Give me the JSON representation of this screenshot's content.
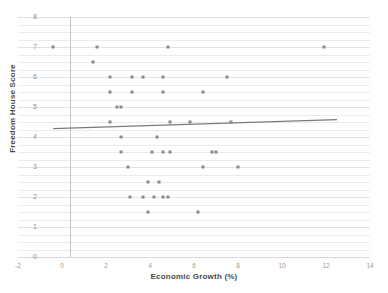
{
  "chart_data": {
    "type": "scatter",
    "title": "",
    "xlabel": "Economic Growth (%)",
    "ylabel": "Freedom House Score",
    "xlim": [
      -2,
      14
    ],
    "ylim": [
      0,
      8
    ],
    "xticks": [
      "-2",
      "0",
      "2",
      "4",
      "6",
      "8",
      "10",
      "12",
      "14"
    ],
    "yticks": [
      "0",
      "1",
      "2",
      "3",
      "4",
      "5",
      "6",
      "7",
      "8"
    ],
    "grid": true,
    "legend": "none",
    "point_color": "#8a8a8a",
    "line_color": "#7a7a7a",
    "grid_color": "#ebebeb",
    "axis_color": "#c6c6c6",
    "points": [
      {
        "x": -0.4,
        "y": 7.0
      },
      {
        "x": 1.6,
        "y": 7.0
      },
      {
        "x": 4.8,
        "y": 7.0
      },
      {
        "x": 11.9,
        "y": 7.0
      },
      {
        "x": 1.4,
        "y": 6.5
      },
      {
        "x": 2.2,
        "y": 6.0
      },
      {
        "x": 3.2,
        "y": 6.0
      },
      {
        "x": 3.7,
        "y": 6.0
      },
      {
        "x": 4.6,
        "y": 6.0
      },
      {
        "x": 7.5,
        "y": 6.0
      },
      {
        "x": 2.2,
        "y": 5.5
      },
      {
        "x": 3.2,
        "y": 5.5
      },
      {
        "x": 4.6,
        "y": 5.5
      },
      {
        "x": 6.4,
        "y": 5.5
      },
      {
        "x": 2.5,
        "y": 5.0
      },
      {
        "x": 2.7,
        "y": 5.0
      },
      {
        "x": 2.2,
        "y": 4.5
      },
      {
        "x": 4.9,
        "y": 4.5
      },
      {
        "x": 5.8,
        "y": 4.5
      },
      {
        "x": 7.7,
        "y": 4.5
      },
      {
        "x": 2.7,
        "y": 4.0
      },
      {
        "x": 4.3,
        "y": 4.0
      },
      {
        "x": 2.7,
        "y": 3.5
      },
      {
        "x": 4.1,
        "y": 3.5
      },
      {
        "x": 4.6,
        "y": 3.5
      },
      {
        "x": 4.9,
        "y": 3.5
      },
      {
        "x": 6.8,
        "y": 3.5
      },
      {
        "x": 7.0,
        "y": 3.5
      },
      {
        "x": 3.0,
        "y": 3.0
      },
      {
        "x": 6.4,
        "y": 3.0
      },
      {
        "x": 8.0,
        "y": 3.0
      },
      {
        "x": 3.9,
        "y": 2.5
      },
      {
        "x": 4.4,
        "y": 2.5
      },
      {
        "x": 3.1,
        "y": 2.0
      },
      {
        "x": 3.7,
        "y": 2.0
      },
      {
        "x": 4.2,
        "y": 2.0
      },
      {
        "x": 4.6,
        "y": 2.0
      },
      {
        "x": 4.8,
        "y": 2.0
      },
      {
        "x": 3.9,
        "y": 1.5
      },
      {
        "x": 6.2,
        "y": 1.5
      }
    ],
    "trend_line": {
      "x_start": -0.4,
      "y_start": 4.28,
      "x_end": 12.5,
      "y_end": 4.58
    }
  }
}
